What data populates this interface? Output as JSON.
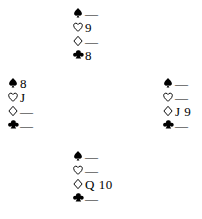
{
  "diagram": {
    "type": "bridge-hand-diagram",
    "suit_order": [
      "spades",
      "hearts",
      "diamonds",
      "clubs"
    ],
    "suit_symbols": {
      "spades": "spade-icon",
      "hearts": "heart-icon",
      "diamonds": "diamond-icon",
      "clubs": "club-icon"
    },
    "void_marker": "—",
    "colors": {
      "ink": "#000000",
      "background": "#ffffff"
    }
  },
  "hands": {
    "north": {
      "position_label": "North",
      "spades": "—",
      "hearts": "9",
      "diamonds": "—",
      "clubs": "8"
    },
    "west": {
      "position_label": "West",
      "spades": "8",
      "hearts": "J",
      "diamonds": "—",
      "clubs": "—"
    },
    "east": {
      "position_label": "East",
      "spades": "—",
      "hearts": "—",
      "diamonds": "J 9",
      "clubs": "—"
    },
    "south": {
      "position_label": "South",
      "spades": "—",
      "hearts": "—",
      "diamonds": "Q 10",
      "clubs": "—"
    }
  }
}
